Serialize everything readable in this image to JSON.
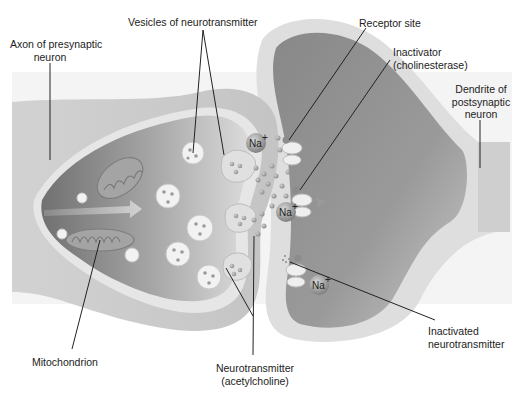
{
  "diagram": {
    "labels": {
      "axon": [
        "Axon of presynaptic",
        "neuron"
      ],
      "vesicles": "Vesicles of neurotransmitter",
      "receptor": "Receptor site",
      "inactivator": [
        "Inactivator",
        "(cholinesterase)"
      ],
      "dendrite": [
        "Dendrite of",
        "postsynaptic",
        "neuron"
      ],
      "mitochondrion": "Mitochondrion",
      "neurotransmitter": [
        "Neurotransmitter",
        "(acetylcholine)"
      ],
      "inactivated": [
        "Inactivated",
        "neurotransmitter"
      ]
    },
    "ions": [
      {
        "symbol": "Na",
        "charge": "+"
      },
      {
        "symbol": "Na",
        "charge": "+"
      },
      {
        "symbol": "Na",
        "charge": "+"
      }
    ],
    "colors": {
      "background": "#ffffff",
      "axon_outer": "#c8c8c8",
      "axon_inner": "#8e8e8e",
      "membrane": "#e4e4e4",
      "dendrite_inner": "#909090",
      "vesicle": "#f2f2f2",
      "ion": "#a0a0a0",
      "leader_line": "#222222"
    }
  }
}
